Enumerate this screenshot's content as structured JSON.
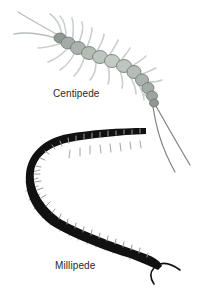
{
  "illustration": {
    "width": 208,
    "height": 291,
    "background": "#ffffff",
    "subjects": [
      {
        "name": "centipede",
        "label": "Centipede",
        "body_color": "#a9b4ad",
        "leg_color": "#c9cfcb",
        "outline_color": "#6e7470"
      },
      {
        "name": "millipede",
        "label": "Millipede",
        "body_color": "#111111",
        "highlight_color": "#9a9a9a",
        "leg_color": "#8a8a8a"
      }
    ]
  }
}
